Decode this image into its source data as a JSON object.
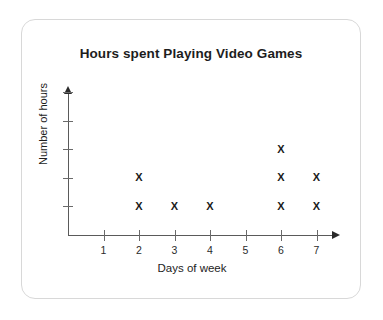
{
  "card": {
    "border_color": "#d8d8d8"
  },
  "chart_data": {
    "type": "scatter",
    "plot_style": "dot-plot",
    "title": "Hours spent Playing Video Games",
    "xlabel": "Days of week",
    "ylabel": "Number of hours",
    "categories": [
      "1",
      "2",
      "3",
      "4",
      "5",
      "6",
      "7"
    ],
    "x": [
      1,
      2,
      3,
      4,
      5,
      6,
      7
    ],
    "values": [
      0,
      2,
      1,
      1,
      0,
      3,
      2
    ],
    "marker": "X",
    "marker_color": "#1a1a1a",
    "axis_color": "#5a5a5a",
    "grid": false,
    "legend": null,
    "xlim": [
      0,
      7
    ],
    "ylim": [
      0,
      5
    ],
    "y_tick_count": 5,
    "y_tick_labels": [
      "",
      "",
      "",
      "",
      ""
    ],
    "x_tick_labels": [
      "1",
      "2",
      "3",
      "4",
      "5",
      "6",
      "7"
    ],
    "points": [
      {
        "day": 2,
        "stack": 1
      },
      {
        "day": 2,
        "stack": 2
      },
      {
        "day": 3,
        "stack": 1
      },
      {
        "day": 4,
        "stack": 1
      },
      {
        "day": 6,
        "stack": 1
      },
      {
        "day": 6,
        "stack": 2
      },
      {
        "day": 6,
        "stack": 3
      },
      {
        "day": 7,
        "stack": 1
      },
      {
        "day": 7,
        "stack": 2
      }
    ]
  }
}
